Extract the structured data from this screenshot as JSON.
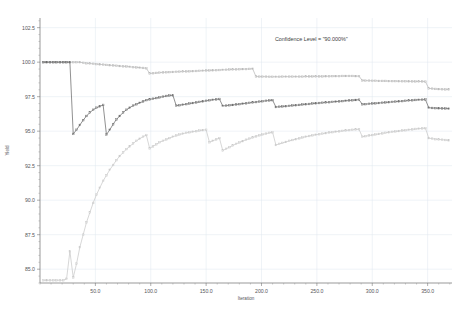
{
  "chart_data": {
    "type": "line",
    "title": "",
    "xlabel": "Iteration",
    "ylabel": "Yield",
    "xlim": [
      0,
      372
    ],
    "ylim": [
      84.0,
      103.2
    ],
    "grid": true,
    "legend": false,
    "annotations": [
      {
        "text": "Confidence Level = \"90.000%\"",
        "x": 245,
        "y": 101.5
      }
    ],
    "xticks": [
      50.0,
      100.0,
      150.0,
      200.0,
      250.0,
      300.0,
      350.0
    ],
    "xtick_labels": [
      "50.0",
      "100.0",
      "150.0",
      "200.0",
      "250.0",
      "300.0",
      "350.0"
    ],
    "yticks": [
      85.0,
      87.5,
      90.0,
      92.5,
      95.0,
      97.5,
      100.0,
      102.5
    ],
    "ytick_labels": [
      "85.0",
      "87.5",
      "90.0",
      "92.5",
      "95.0",
      "97.5",
      "100.0",
      "102.5"
    ],
    "series": [
      {
        "name": "upper-confidence-bound",
        "color": "#b9b9b9",
        "marker": "circle",
        "x": [
          3,
          6,
          9,
          12,
          15,
          18,
          21,
          24,
          27,
          30,
          33,
          36,
          39,
          42,
          45,
          48,
          51,
          54,
          57,
          60,
          63,
          66,
          69,
          72,
          75,
          78,
          81,
          84,
          87,
          90,
          93,
          96,
          99,
          102,
          105,
          108,
          111,
          114,
          117,
          120,
          123,
          126,
          129,
          132,
          135,
          138,
          141,
          144,
          147,
          150,
          153,
          156,
          159,
          162,
          165,
          168,
          171,
          174,
          177,
          180,
          183,
          186,
          189,
          192,
          195,
          198,
          201,
          204,
          207,
          210,
          213,
          216,
          219,
          222,
          225,
          228,
          231,
          234,
          237,
          240,
          243,
          246,
          249,
          252,
          255,
          258,
          261,
          264,
          267,
          270,
          273,
          276,
          279,
          282,
          285,
          288,
          291,
          294,
          297,
          300,
          303,
          306,
          309,
          312,
          315,
          318,
          321,
          324,
          327,
          330,
          333,
          336,
          339,
          342,
          345,
          348,
          351,
          354,
          357,
          360,
          363,
          366,
          369
        ],
        "values": [
          100.0,
          100.0,
          100.0,
          100.0,
          100.0,
          100.0,
          100.0,
          100.0,
          100.0,
          100.0,
          100.0,
          100.0,
          99.95,
          99.92,
          99.9,
          99.88,
          99.86,
          99.84,
          99.82,
          99.8,
          99.78,
          99.76,
          99.74,
          99.72,
          99.7,
          99.68,
          99.66,
          99.64,
          99.62,
          99.6,
          99.58,
          99.56,
          99.18,
          99.2,
          99.22,
          99.24,
          99.26,
          99.27,
          99.28,
          99.29,
          99.3,
          99.31,
          99.32,
          99.33,
          99.34,
          99.35,
          99.36,
          99.37,
          99.38,
          99.39,
          99.4,
          99.41,
          99.42,
          99.43,
          99.44,
          99.45,
          99.46,
          99.47,
          99.48,
          99.49,
          99.5,
          99.5,
          99.51,
          99.52,
          98.96,
          98.95,
          98.95,
          98.95,
          98.94,
          98.94,
          98.94,
          98.94,
          98.95,
          98.95,
          98.95,
          98.95,
          98.95,
          98.95,
          98.95,
          98.96,
          98.96,
          98.96,
          98.97,
          98.97,
          98.97,
          98.98,
          98.98,
          98.99,
          98.99,
          98.99,
          99.0,
          99.0,
          99.0,
          99.0,
          98.99,
          98.99,
          98.67,
          98.66,
          98.66,
          98.65,
          98.65,
          98.64,
          98.64,
          98.64,
          98.63,
          98.63,
          98.63,
          98.62,
          98.62,
          98.62,
          98.61,
          98.61,
          98.6,
          98.6,
          98.6,
          98.59,
          98.1,
          98.08,
          98.06,
          98.05,
          98.04,
          98.03,
          98.02
        ]
      },
      {
        "name": "mean-estimate",
        "color": "#6c6c6c",
        "marker": "circle",
        "x": [
          3,
          6,
          9,
          12,
          15,
          18,
          21,
          24,
          27,
          30,
          33,
          36,
          39,
          42,
          45,
          48,
          51,
          54,
          57,
          60,
          63,
          66,
          69,
          72,
          75,
          78,
          81,
          84,
          87,
          90,
          93,
          96,
          99,
          102,
          105,
          108,
          111,
          114,
          117,
          120,
          123,
          126,
          129,
          132,
          135,
          138,
          141,
          144,
          147,
          150,
          153,
          156,
          159,
          162,
          165,
          168,
          171,
          174,
          177,
          180,
          183,
          186,
          189,
          192,
          195,
          198,
          201,
          204,
          207,
          210,
          213,
          216,
          219,
          222,
          225,
          228,
          231,
          234,
          237,
          240,
          243,
          246,
          249,
          252,
          255,
          258,
          261,
          264,
          267,
          270,
          273,
          276,
          279,
          282,
          285,
          288,
          291,
          294,
          297,
          300,
          303,
          306,
          309,
          312,
          315,
          318,
          321,
          324,
          327,
          330,
          333,
          336,
          339,
          342,
          345,
          348,
          351,
          354,
          357,
          360,
          363,
          366,
          369
        ],
        "values": [
          100.0,
          100.0,
          100.0,
          100.0,
          100.0,
          100.0,
          100.0,
          100.0,
          100.0,
          94.8,
          95.1,
          95.45,
          95.8,
          96.1,
          96.35,
          96.55,
          96.7,
          96.8,
          96.9,
          94.75,
          95.1,
          95.5,
          95.85,
          96.1,
          96.35,
          96.55,
          96.7,
          96.85,
          96.95,
          97.05,
          97.15,
          97.25,
          97.3,
          97.35,
          97.4,
          97.45,
          97.5,
          97.55,
          97.58,
          97.6,
          96.85,
          96.88,
          96.92,
          96.96,
          97.0,
          97.04,
          97.08,
          97.12,
          97.16,
          97.2,
          97.24,
          97.27,
          97.3,
          97.33,
          96.83,
          96.85,
          96.88,
          96.9,
          96.93,
          96.96,
          96.99,
          97.02,
          97.05,
          97.08,
          97.11,
          97.14,
          97.17,
          97.2,
          97.22,
          97.25,
          96.75,
          96.77,
          96.79,
          96.81,
          96.83,
          96.86,
          96.88,
          96.9,
          96.93,
          96.95,
          96.97,
          97.0,
          97.02,
          97.04,
          97.06,
          97.08,
          97.1,
          97.12,
          97.14,
          97.16,
          97.18,
          97.2,
          97.22,
          97.24,
          97.26,
          97.28,
          96.95,
          96.96,
          96.98,
          97.0,
          97.02,
          97.04,
          97.06,
          97.08,
          97.1,
          97.12,
          97.14,
          97.16,
          97.18,
          97.2,
          97.22,
          97.24,
          97.26,
          97.27,
          97.28,
          97.29,
          96.7,
          96.68,
          96.67,
          96.66,
          96.65,
          96.64,
          96.63
        ]
      },
      {
        "name": "lower-confidence-bound",
        "color": "#c9c9c9",
        "marker": "circle",
        "x": [
          3,
          6,
          9,
          12,
          15,
          18,
          21,
          24,
          27,
          30,
          33,
          36,
          39,
          42,
          45,
          48,
          51,
          54,
          57,
          60,
          63,
          66,
          69,
          72,
          75,
          78,
          81,
          84,
          87,
          90,
          93,
          96,
          99,
          102,
          105,
          108,
          111,
          114,
          117,
          120,
          123,
          126,
          129,
          132,
          135,
          138,
          141,
          144,
          147,
          150,
          153,
          156,
          159,
          162,
          165,
          168,
          171,
          174,
          177,
          180,
          183,
          186,
          189,
          192,
          195,
          198,
          201,
          204,
          207,
          210,
          213,
          216,
          219,
          222,
          225,
          228,
          231,
          234,
          237,
          240,
          243,
          246,
          249,
          252,
          255,
          258,
          261,
          264,
          267,
          270,
          273,
          276,
          279,
          282,
          285,
          288,
          291,
          294,
          297,
          300,
          303,
          306,
          309,
          312,
          315,
          318,
          321,
          324,
          327,
          330,
          333,
          336,
          339,
          342,
          345,
          348,
          351,
          354,
          357,
          360,
          363,
          366,
          369
        ],
        "values": [
          84.2,
          84.2,
          84.2,
          84.2,
          84.2,
          84.2,
          84.2,
          84.3,
          86.3,
          84.4,
          85.4,
          86.6,
          87.5,
          88.4,
          89.1,
          89.8,
          90.4,
          90.9,
          91.4,
          91.8,
          92.2,
          92.55,
          92.9,
          93.2,
          93.45,
          93.7,
          93.9,
          94.1,
          94.3,
          94.45,
          94.6,
          94.72,
          93.75,
          93.9,
          94.05,
          94.2,
          94.3,
          94.4,
          94.5,
          94.6,
          94.68,
          94.76,
          94.82,
          94.88,
          94.92,
          94.96,
          95.0,
          95.04,
          95.08,
          95.1,
          94.2,
          94.3,
          94.4,
          94.5,
          93.6,
          93.72,
          93.84,
          93.96,
          94.08,
          94.18,
          94.28,
          94.38,
          94.46,
          94.54,
          94.62,
          94.7,
          94.76,
          94.82,
          94.88,
          94.92,
          94.0,
          94.08,
          94.15,
          94.22,
          94.3,
          94.36,
          94.42,
          94.48,
          94.54,
          94.6,
          94.65,
          94.7,
          94.74,
          94.78,
          94.82,
          94.86,
          94.9,
          94.93,
          94.96,
          94.99,
          95.02,
          95.05,
          95.08,
          95.1,
          95.12,
          95.14,
          94.6,
          94.64,
          94.68,
          94.72,
          94.76,
          94.8,
          94.84,
          94.88,
          94.92,
          94.95,
          94.98,
          95.01,
          95.04,
          95.07,
          95.1,
          95.13,
          95.16,
          95.18,
          95.2,
          95.22,
          94.5,
          94.46,
          94.42,
          94.4,
          94.38,
          94.36,
          94.34
        ]
      }
    ]
  }
}
